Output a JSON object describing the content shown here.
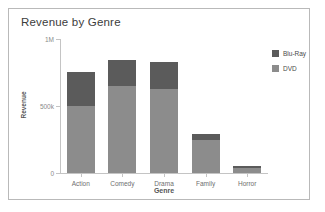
{
  "chart_data": {
    "type": "bar",
    "stacked": true,
    "title": "Revenue by Genre",
    "xlabel": "Genre",
    "ylabel": "Revenue",
    "categories": [
      "Action",
      "Comedy",
      "Drama",
      "Family",
      "Horror"
    ],
    "series": [
      {
        "name": "DVD",
        "color": "#8c8c8c",
        "values": [
          500000,
          650000,
          625000,
          245000,
          37000
        ]
      },
      {
        "name": "Blu-Ray",
        "color": "#5b5b5b",
        "values": [
          255000,
          195000,
          205000,
          45000,
          15000
        ]
      }
    ],
    "totals": [
      755000,
      845000,
      830000,
      290000,
      52000
    ],
    "ylim": [
      0,
      1000000
    ],
    "yticks": [
      0,
      500000,
      1000000
    ],
    "ytick_labels": [
      "0",
      "500k",
      "1M"
    ],
    "grid": false,
    "legend_position": "right",
    "legend_order": [
      "Blu-Ray",
      "DVD"
    ]
  },
  "legend": {
    "items": [
      {
        "label": "Blu-Ray",
        "color": "#5b5b5b"
      },
      {
        "label": "DVD",
        "color": "#8c8c8c"
      }
    ]
  },
  "colors": {
    "panel_border": "#b9b9b9",
    "axis": "#c4c4c4",
    "background": "#ffffff",
    "title_text": "#3c3c3c",
    "tick_text": "#8a8a8a"
  }
}
